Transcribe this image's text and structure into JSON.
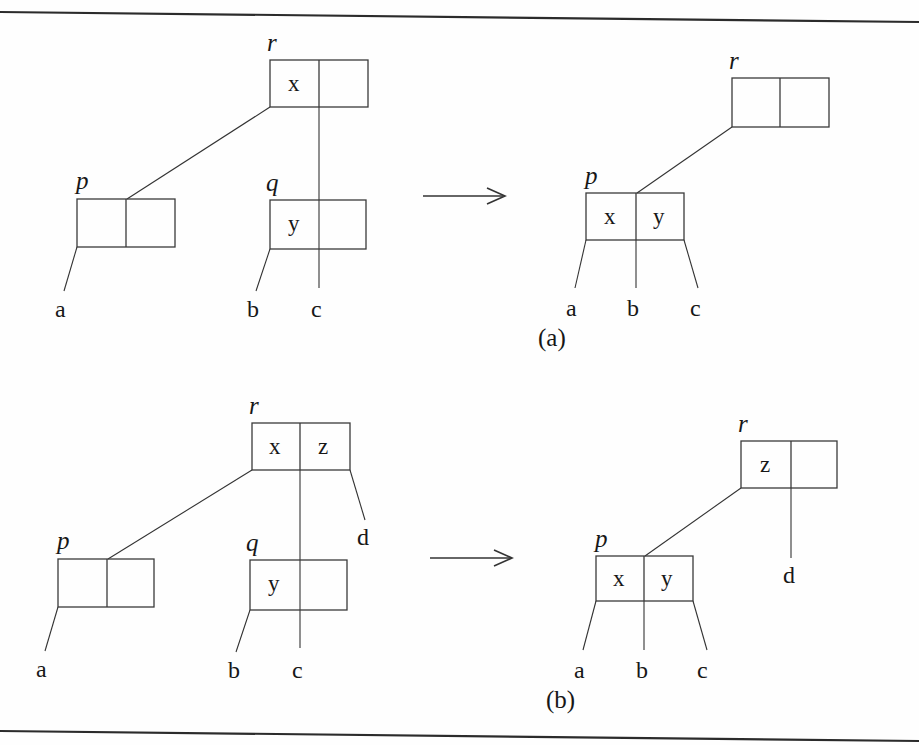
{
  "figure": {
    "caption_a": "(a)",
    "caption_b": "(b)",
    "arrow_icon": "right-arrow-icon",
    "panels": {
      "a": {
        "before": {
          "nodes": [
            {
              "pointer": "r",
              "keys": [
                "x",
                ""
              ]
            },
            {
              "pointer": "p",
              "keys": [
                "",
                ""
              ]
            },
            {
              "pointer": "q",
              "keys": [
                "y",
                ""
              ]
            }
          ],
          "children": [
            "a",
            "b",
            "c"
          ]
        },
        "after": {
          "nodes": [
            {
              "pointer": "r",
              "keys": [
                "",
                ""
              ]
            },
            {
              "pointer": "p",
              "keys": [
                "x",
                "y"
              ]
            }
          ],
          "children": [
            "a",
            "b",
            "c"
          ]
        }
      },
      "b": {
        "before": {
          "nodes": [
            {
              "pointer": "r",
              "keys": [
                "x",
                "z"
              ]
            },
            {
              "pointer": "p",
              "keys": [
                "",
                ""
              ]
            },
            {
              "pointer": "q",
              "keys": [
                "y",
                ""
              ]
            }
          ],
          "children": [
            "a",
            "b",
            "c",
            "d"
          ]
        },
        "after": {
          "nodes": [
            {
              "pointer": "r",
              "keys": [
                "z",
                ""
              ]
            },
            {
              "pointer": "p",
              "keys": [
                "x",
                "y"
              ]
            }
          ],
          "children": [
            "a",
            "b",
            "c",
            "d"
          ]
        }
      }
    },
    "colors": {
      "ink": "#171717",
      "line": "#333333",
      "rule": "#2b2b2b",
      "background": "#fefefe"
    }
  }
}
